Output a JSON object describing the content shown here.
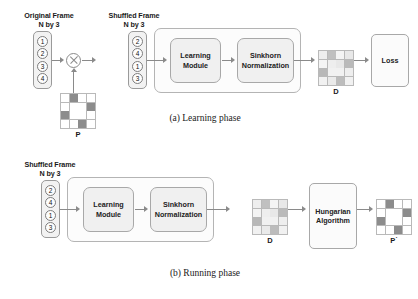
{
  "figure": {
    "panels": [
      {
        "id": "learning",
        "caption": "(a) Learning phase",
        "input_label_line1": "Original Frame",
        "input_label_line2": "N by 3",
        "shuffled_label_line1": "Shuffled Frame",
        "shuffled_label_line2": "N by 3",
        "original_frame_items": [
          "1",
          "2",
          "3",
          "4"
        ],
        "shuffled_frame_items": [
          "2",
          "4",
          "1",
          "3"
        ],
        "operator": "circled-times",
        "permutation_label": "P",
        "module_1": "Learning\nModule",
        "module_1_line1": "Learning",
        "module_1_line2": "Module",
        "module_2_line1": "Sinkhorn",
        "module_2_line2": "Normalization",
        "doubly_stochastic_label": "D",
        "loss_label": "Loss"
      },
      {
        "id": "running",
        "caption": "(b) Running phase",
        "shuffled_label_line1": "Shuffled Frame",
        "shuffled_label_line2": "N by 3",
        "shuffled_frame_items": [
          "2",
          "4",
          "1",
          "3"
        ],
        "module_1_line1": "Learning",
        "module_1_line2": "Module",
        "module_2_line1": "Sinkhorn",
        "module_2_line2": "Normalization",
        "doubly_stochastic_label": "D",
        "hungarian_line1": "Hungarian",
        "hungarian_line2": "Algorithm",
        "recovered_permutation_label": "P˙"
      }
    ]
  },
  "chart_data": {
    "type": "heatmap",
    "matrices": [
      {
        "name": "P",
        "panel": "learning",
        "rows": 4,
        "cols": 4,
        "description": "binary permutation matrix",
        "values": [
          [
            0,
            1,
            0,
            0
          ],
          [
            0,
            0,
            0,
            1
          ],
          [
            1,
            0,
            0,
            0
          ],
          [
            0,
            0,
            1,
            0
          ]
        ]
      },
      {
        "name": "D",
        "panel": "learning",
        "rows": 4,
        "cols": 4,
        "description": "doubly stochastic soft assignment matrix",
        "values": [
          [
            0.15,
            0.55,
            0.1,
            0.2
          ],
          [
            0.1,
            0.15,
            0.2,
            0.6
          ],
          [
            0.62,
            0.12,
            0.12,
            0.15
          ],
          [
            0.12,
            0.18,
            0.58,
            0.12
          ]
        ]
      },
      {
        "name": "D",
        "panel": "running",
        "rows": 4,
        "cols": 4,
        "description": "doubly stochastic soft assignment matrix",
        "values": [
          [
            0.15,
            0.55,
            0.1,
            0.2
          ],
          [
            0.1,
            0.15,
            0.2,
            0.6
          ],
          [
            0.62,
            0.12,
            0.12,
            0.15
          ],
          [
            0.12,
            0.18,
            0.58,
            0.12
          ]
        ]
      },
      {
        "name": "P'",
        "panel": "running",
        "rows": 4,
        "cols": 4,
        "description": "recovered binary permutation matrix",
        "values": [
          [
            0,
            1,
            0,
            0
          ],
          [
            0,
            0,
            0,
            1
          ],
          [
            1,
            0,
            0,
            0
          ],
          [
            0,
            0,
            1,
            0
          ]
        ]
      }
    ],
    "colors": {
      "cell_min": "#ffffff",
      "cell_max": "#8c8c8c",
      "grid": "#b9b9b9",
      "stroke": "#9a9a9a",
      "arrow": "#8a8a8a",
      "module_fill": "#f0f0f0",
      "outer_fill": "#fcfcfc"
    }
  }
}
